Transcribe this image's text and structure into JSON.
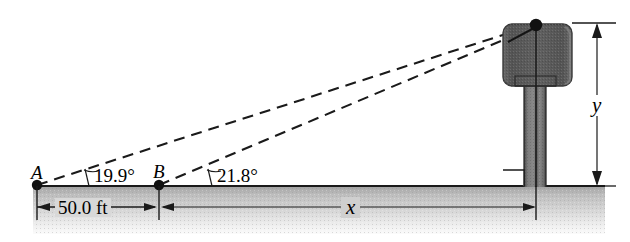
{
  "figure": {
    "type": "trigonometry-diagram",
    "colors": {
      "line": "#1a1a1a",
      "ground_top": "#9a9a9a",
      "ground_bottom": "#f2f2f2",
      "tank_fill": "#5e5e5e",
      "column_fill": "#6f6f6f",
      "background": "#ffffff"
    },
    "points": {
      "a_label": "A",
      "b_label": "B"
    },
    "angles": {
      "at_a": "19.9°",
      "at_b": "21.8°"
    },
    "dimensions": {
      "baseline": "50.0 ft",
      "horizontal_unknown": "x",
      "vertical_unknown": "y"
    },
    "annotations": {
      "right_angle": "right-angle marker at tower base"
    }
  }
}
